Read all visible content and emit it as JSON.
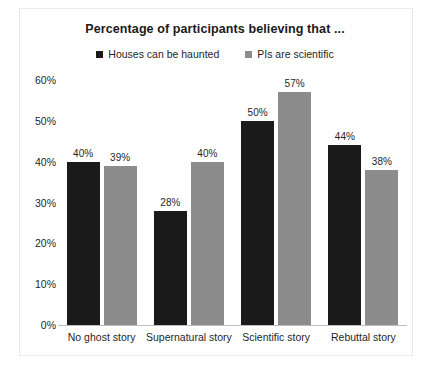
{
  "chart_data": {
    "type": "bar",
    "title": "Percentage of participants believing that ...",
    "xlabel": "",
    "ylabel": "",
    "ylim": [
      0,
      60
    ],
    "ytick_labels": [
      "0%",
      "10%",
      "20%",
      "30%",
      "40%",
      "50%",
      "60%"
    ],
    "ytick_values": [
      0,
      10,
      20,
      30,
      40,
      50,
      60
    ],
    "grid": false,
    "legend_position": "top",
    "categories": [
      "No ghost story",
      "Supernatural story",
      "Scientific story",
      "Rebuttal story"
    ],
    "series": [
      {
        "name": "Houses can be haunted",
        "color": "#1a1a1a",
        "values": [
          40,
          28,
          50,
          44
        ],
        "labels": [
          "40%",
          "28%",
          "50%",
          "44%"
        ]
      },
      {
        "name": "PIs are scientific",
        "color": "#8c8c8c",
        "values": [
          39,
          40,
          57,
          38
        ],
        "labels": [
          "39%",
          "40%",
          "57%",
          "38%"
        ]
      }
    ]
  },
  "colors": {
    "series_1": "#1a1a1a",
    "series_2": "#8c8c8c",
    "text": "#1f1f1f",
    "border": "#e9e9e9",
    "baseline": "#bdbdbd",
    "background": "#ffffff"
  }
}
